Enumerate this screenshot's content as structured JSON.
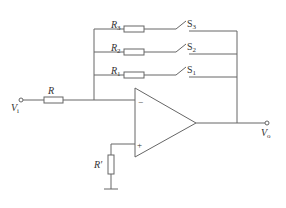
{
  "diagram": {
    "type": "circuit-schematic",
    "colors": {
      "wire": "#666666",
      "text": "#333333",
      "background": "#ffffff"
    },
    "labels": {
      "input": "V",
      "input_sub": "i",
      "output": "V",
      "output_sub": "o",
      "r_in": "R",
      "r_bias": "R′",
      "r1": "R",
      "r1_sub": "1",
      "r2": "R",
      "r2_sub": "2",
      "r3": "R",
      "r3_sub": "3",
      "s1": "S",
      "s1_sub": "1",
      "s2": "S",
      "s2_sub": "2",
      "s3": "S",
      "s3_sub": "3",
      "inv_sign": "−",
      "noninv_sign": "+"
    },
    "components": [
      {
        "id": "R",
        "kind": "resistor",
        "between": [
          "Vi",
          "inverting-input"
        ]
      },
      {
        "id": "R1",
        "kind": "resistor",
        "series_with": "S1",
        "role": "feedback"
      },
      {
        "id": "R2",
        "kind": "resistor",
        "series_with": "S2",
        "role": "feedback"
      },
      {
        "id": "R3",
        "kind": "resistor",
        "series_with": "S3",
        "role": "feedback"
      },
      {
        "id": "S1",
        "kind": "switch",
        "state": "open"
      },
      {
        "id": "S2",
        "kind": "switch",
        "state": "open"
      },
      {
        "id": "S3",
        "kind": "switch",
        "state": "open"
      },
      {
        "id": "R'",
        "kind": "resistor",
        "between": [
          "non-inverting-input",
          "ground"
        ]
      },
      {
        "id": "op-amp",
        "kind": "operational-amplifier"
      }
    ]
  }
}
